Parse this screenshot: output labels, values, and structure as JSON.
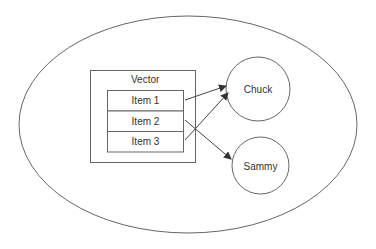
{
  "diagram": {
    "container": {
      "label": "Vector"
    },
    "items": [
      {
        "label": "Item 1"
      },
      {
        "label": "Item 2"
      },
      {
        "label": "Item 3"
      }
    ],
    "nodes": [
      {
        "label": "Chuck"
      },
      {
        "label": "Sammy"
      }
    ],
    "edges": [
      {
        "from": "Item 1",
        "to": "Chuck"
      },
      {
        "from": "Item 2",
        "to": "Sammy"
      },
      {
        "from": "Item 3",
        "to": "Chuck"
      }
    ],
    "colors": {
      "stroke": "#555555",
      "text": "#333333",
      "background": "#ffffff"
    }
  }
}
